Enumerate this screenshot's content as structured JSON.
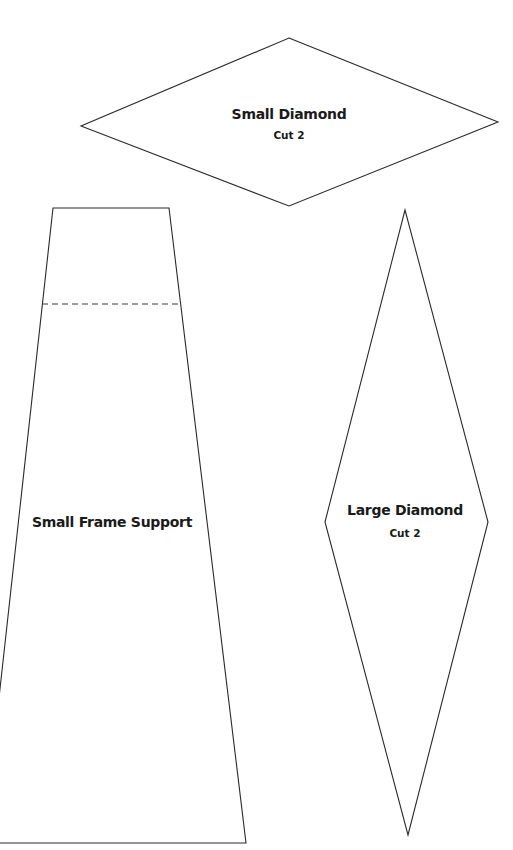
{
  "pattern_pieces": [
    {
      "id": "small-diamond",
      "title": "Small Diamond",
      "instruction": "Cut 2",
      "shape": "diamond",
      "points": [
        [
          289,
          38
        ],
        [
          498,
          122
        ],
        [
          289,
          206
        ],
        [
          81,
          126
        ]
      ]
    },
    {
      "id": "small-frame-support",
      "title": "Small Frame Support",
      "instruction": "",
      "shape": "trapezoid",
      "points": [
        [
          53,
          208
        ],
        [
          169,
          208
        ],
        [
          246,
          843
        ],
        [
          -17,
          843
        ]
      ],
      "fold_line": {
        "style": "dashed",
        "y": 304,
        "x1": 42,
        "x2": 181
      }
    },
    {
      "id": "large-diamond",
      "title": "Large Diamond",
      "instruction": "Cut 2",
      "shape": "diamond",
      "points": [
        [
          405,
          210
        ],
        [
          488,
          522
        ],
        [
          408,
          835
        ],
        [
          325,
          522
        ]
      ]
    }
  ],
  "labels": {
    "small_diamond": {
      "title": "Small Diamond",
      "sub": "Cut 2"
    },
    "small_frame_support": {
      "title": "Small Frame Support"
    },
    "large_diamond": {
      "title": "Large Diamond",
      "sub": "Cut 2"
    }
  },
  "colors": {
    "background": "#ffffff",
    "outline": "#2a2a2a",
    "text": "#1a1a1a"
  }
}
